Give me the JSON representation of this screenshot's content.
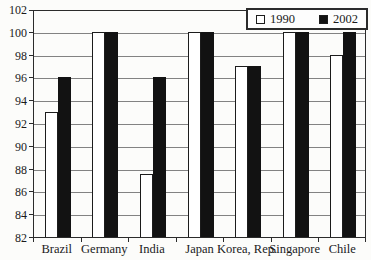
{
  "chart_data": {
    "type": "bar",
    "title": "",
    "categories": [
      "Brazil",
      "Germany",
      "India",
      "Japan",
      "Korea, Rep.",
      "Singapore",
      "Chile"
    ],
    "series": [
      {
        "name": "1990",
        "fill": "#ffffff",
        "values": [
          93,
          100,
          87.5,
          100,
          97,
          100,
          98
        ]
      },
      {
        "name": "2002",
        "fill": "#121212",
        "values": [
          96,
          100,
          96,
          100,
          97,
          100,
          100
        ]
      }
    ],
    "ylim": [
      82,
      102
    ],
    "ytick_step": 2,
    "ytick_labels": [
      "82",
      "84",
      "86",
      "88",
      "90",
      "92",
      "94",
      "96",
      "98",
      "100",
      "102"
    ],
    "grid": true,
    "legend_position": "top-right"
  },
  "colors": {
    "background": "#fcfcfa",
    "grid": "#828282",
    "axis": "#2b2b2b",
    "bar_border": "#1c1c1c",
    "legend_border": "#2b2b2b"
  }
}
